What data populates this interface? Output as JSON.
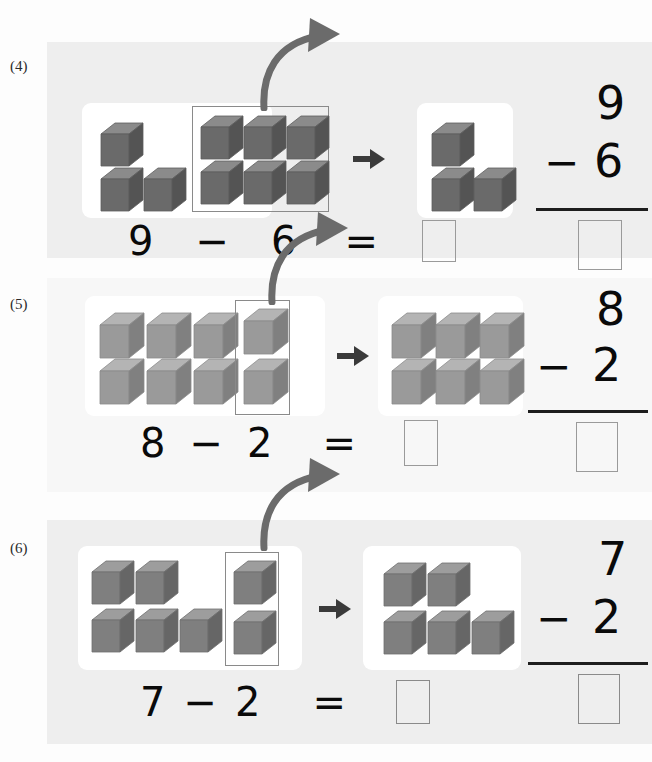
{
  "worksheet": {
    "title": "Subtraction with cube models",
    "cube_color": {
      "top": "#b4b4b4",
      "front": "#8e8e8e",
      "side": "#6f6f6f",
      "outline": "#5e5e5e",
      "top_dark": "#8b8b8b",
      "front_dark": "#6a6a6a",
      "side_dark": "#545454"
    },
    "panel_color": "#ededed",
    "card_color": "#ffffff",
    "arrow_color": "#6b6b6b",
    "select_border_color": "#8a8a8a",
    "answer_box_border": "#9a9a9a"
  },
  "problems": [
    {
      "index": "(4)",
      "before_total": 9,
      "removed": 6,
      "after_total": 3,
      "cube_tone": "dark",
      "left_card": {
        "free_cubes": [
          {
            "row": 0,
            "col": 0
          },
          {
            "row": 1,
            "col": 0
          },
          {
            "row": 1,
            "col": 1
          }
        ],
        "boxed_cubes": [
          {
            "row": 0,
            "col": 0
          },
          {
            "row": 0,
            "col": 1
          },
          {
            "row": 0,
            "col": 2
          },
          {
            "row": 1,
            "col": 0
          },
          {
            "row": 1,
            "col": 1
          },
          {
            "row": 1,
            "col": 2
          }
        ],
        "boxed_label": "group-of-6-removed"
      },
      "right_card": {
        "cubes": [
          {
            "row": 0,
            "col": 0
          },
          {
            "row": 1,
            "col": 0
          },
          {
            "row": 1,
            "col": 1
          }
        ]
      },
      "equation": {
        "minuend": "9",
        "minus": "−",
        "subtrahend": "6",
        "equals": "=",
        "answer": ""
      },
      "vertical": {
        "minuend": "9",
        "minus": "−",
        "subtrahend": "6",
        "answer": ""
      }
    },
    {
      "index": "(5)",
      "before_total": 8,
      "removed": 2,
      "after_total": 6,
      "cube_tone": "light",
      "left_card": {
        "free_cubes": [
          {
            "row": 0,
            "col": 0
          },
          {
            "row": 0,
            "col": 1
          },
          {
            "row": 0,
            "col": 2
          },
          {
            "row": 1,
            "col": 0
          },
          {
            "row": 1,
            "col": 1
          },
          {
            "row": 1,
            "col": 2
          }
        ],
        "boxed_cubes": [
          {
            "row": 0,
            "col": 0
          },
          {
            "row": 1,
            "col": 0
          }
        ],
        "boxed_label": "column-of-2-removed"
      },
      "right_card": {
        "cubes": [
          {
            "row": 0,
            "col": 0
          },
          {
            "row": 0,
            "col": 1
          },
          {
            "row": 0,
            "col": 2
          },
          {
            "row": 1,
            "col": 0
          },
          {
            "row": 1,
            "col": 1
          },
          {
            "row": 1,
            "col": 2
          }
        ]
      },
      "equation": {
        "minuend": "8",
        "minus": "−",
        "subtrahend": "2",
        "equals": "=",
        "answer": ""
      },
      "vertical": {
        "minuend": "8",
        "minus": "−",
        "subtrahend": "2",
        "answer": ""
      }
    },
    {
      "index": "(6)",
      "before_total": 7,
      "removed": 2,
      "after_total": 5,
      "cube_tone": "dark",
      "left_card": {
        "free_cubes": [
          {
            "row": 0,
            "col": 0
          },
          {
            "row": 0,
            "col": 1
          },
          {
            "row": 1,
            "col": 0
          },
          {
            "row": 1,
            "col": 1
          },
          {
            "row": 1,
            "col": 2
          }
        ],
        "boxed_cubes": [
          {
            "row": 0,
            "col": 0
          },
          {
            "row": 1,
            "col": 0
          }
        ],
        "boxed_label": "column-of-2-removed"
      },
      "right_card": {
        "cubes": [
          {
            "row": 0,
            "col": 0
          },
          {
            "row": 0,
            "col": 1
          },
          {
            "row": 1,
            "col": 0
          },
          {
            "row": 1,
            "col": 1
          },
          {
            "row": 1,
            "col": 2
          }
        ]
      },
      "equation": {
        "minuend": "7",
        "minus": "−",
        "subtrahend": "2",
        "equals": "=",
        "answer": ""
      },
      "vertical": {
        "minuend": "7",
        "minus": "−",
        "subtrahend": "2",
        "answer": ""
      }
    }
  ]
}
